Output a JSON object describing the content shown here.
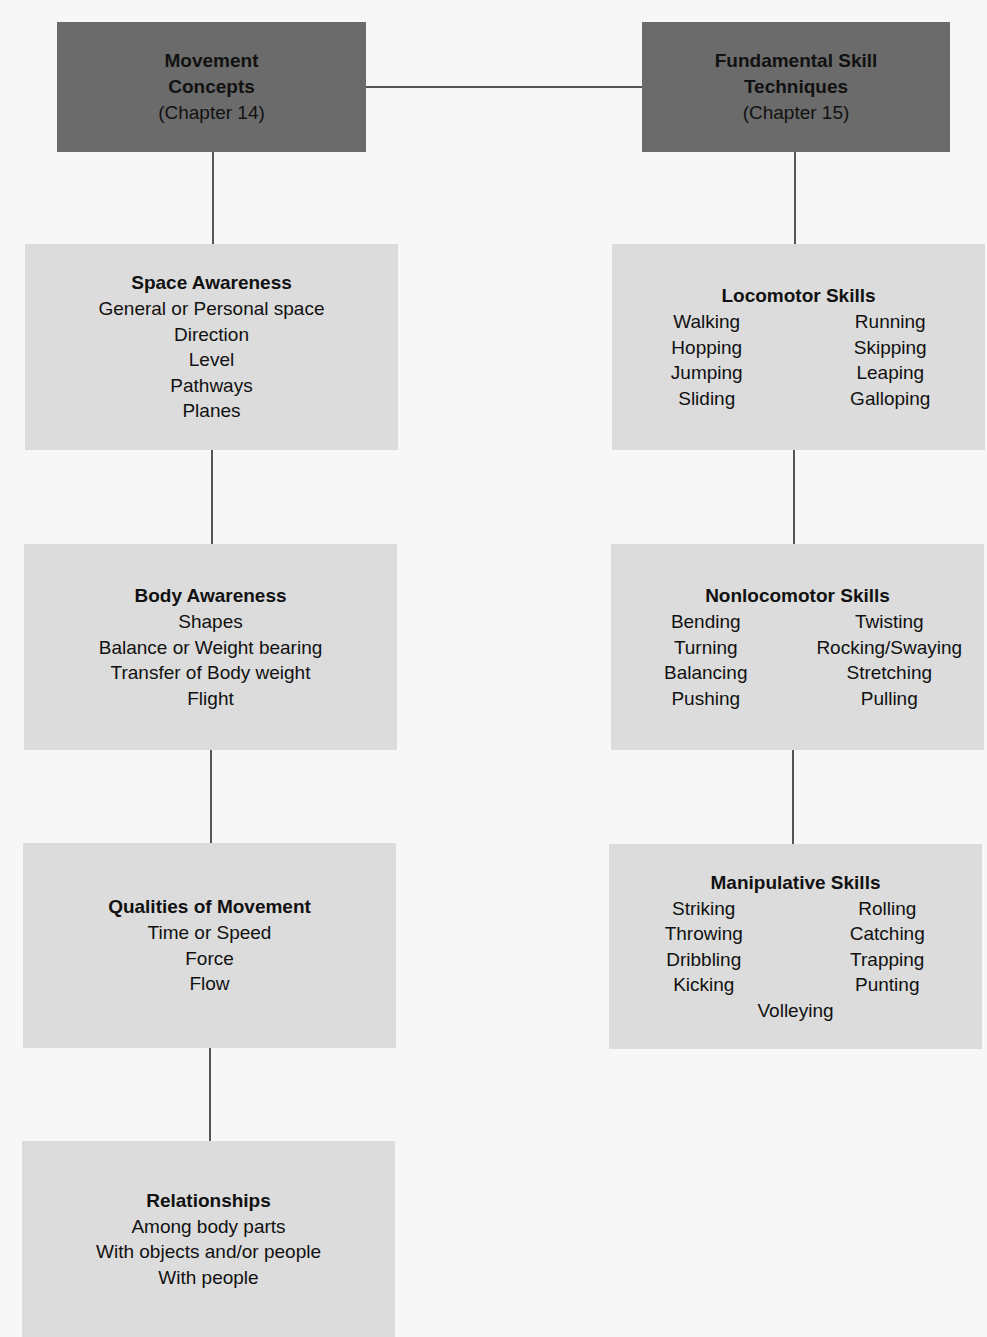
{
  "headers": {
    "left": {
      "title_line1": "Movement",
      "title_line2": "Concepts",
      "subtitle": "(Chapter 14)"
    },
    "right": {
      "title_line1": "Fundamental Skill",
      "title_line2": "Techniques",
      "subtitle": "(Chapter 15)"
    }
  },
  "left_column": {
    "space": {
      "title": "Space Awareness",
      "items": [
        "General or Personal space",
        "Direction",
        "Level",
        "Pathways",
        "Planes"
      ]
    },
    "body": {
      "title": "Body Awareness",
      "items": [
        "Shapes",
        "Balance or Weight bearing",
        "Transfer of Body weight",
        "Flight"
      ]
    },
    "qualities": {
      "title": "Qualities of Movement",
      "items": [
        "Time or Speed",
        "Force",
        "Flow"
      ]
    },
    "relationships": {
      "title": "Relationships",
      "items": [
        "Among body parts",
        "With objects and/or people",
        "With people"
      ]
    }
  },
  "right_column": {
    "locomotor": {
      "title": "Locomotor Skills",
      "items": [
        "Walking",
        "Running",
        "Hopping",
        "Skipping",
        "Jumping",
        "Leaping",
        "Sliding",
        "Galloping"
      ]
    },
    "nonlocomotor": {
      "title": "Nonlocomotor Skills",
      "items": [
        "Bending",
        "Twisting",
        "Turning",
        "Rocking/Swaying",
        "Balancing",
        "Stretching",
        "Pushing",
        "Pulling"
      ]
    },
    "manipulative": {
      "title": "Manipulative Skills",
      "items": [
        "Striking",
        "Rolling",
        "Throwing",
        "Catching",
        "Dribbling",
        "Trapping",
        "Kicking",
        "Punting"
      ],
      "last_item": "Volleying"
    }
  },
  "colors": {
    "header_bg": "#6b6b6b",
    "box_bg": "#dcdcdc",
    "connector": "#555555"
  }
}
